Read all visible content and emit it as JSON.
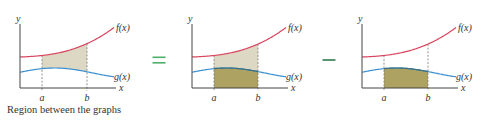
{
  "diagram": {
    "caption": "Region between the graphs",
    "operators": [
      {
        "symbol": "=",
        "name": "equals",
        "x": 159,
        "y": 60,
        "color": "#4caf6a"
      },
      {
        "symbol": "−",
        "name": "minus",
        "x": 329,
        "y": 60,
        "color": "#2e7d4f"
      }
    ],
    "colors": {
      "f_curve": "#d9455f",
      "g_curve": "#3a8fd0",
      "g_curve_on_fill": "#3f6f7a",
      "axis": "#444444",
      "dashed": "#777777",
      "light_fill": "#ddd8c4",
      "dark_fill": "#ada262",
      "label": "#333333"
    },
    "labels": {
      "y_axis": "y",
      "x_axis": "x",
      "f": "f(x)",
      "g": "g(x)",
      "a": "a",
      "b": "b"
    },
    "panels": [
      {
        "name": "region-between-graphs",
        "origin_x": 20,
        "axis_y": 88,
        "axis_top": 24,
        "axis_right": 116,
        "a_x": 42,
        "b_x": 87,
        "fill": "between"
      },
      {
        "name": "area-under-f",
        "origin_x": 192,
        "axis_y": 88,
        "axis_top": 24,
        "axis_right": 288,
        "a_x": 214,
        "b_x": 258,
        "fill": "under-f"
      },
      {
        "name": "area-under-g",
        "origin_x": 362,
        "axis_y": 88,
        "axis_top": 24,
        "axis_right": 458,
        "a_x": 384,
        "b_x": 428,
        "fill": "under-g"
      }
    ]
  }
}
